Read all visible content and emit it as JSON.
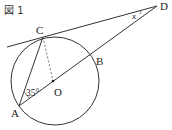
{
  "figure": {
    "title": "図 1",
    "points": {
      "A": "A",
      "B": "B",
      "C": "C",
      "D": "D",
      "O": "O"
    },
    "angle_A": "35°",
    "angle_D": "x"
  }
}
